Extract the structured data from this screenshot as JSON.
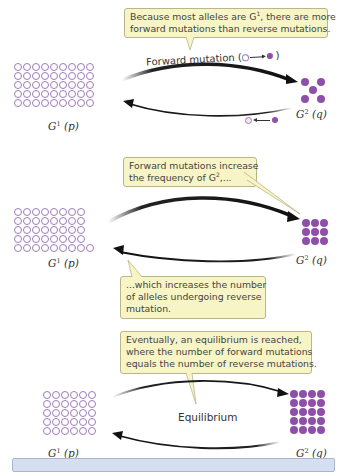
{
  "colors": {
    "allele_g1_outline": "#9d7cb8",
    "allele_g2_fill": "#8e4fa8",
    "callout_bg": "#f7f4c5",
    "callout_border": "#b9b68a",
    "caption_bg": "#d6dff0"
  },
  "panels": [
    {
      "callout_html_parts": {
        "line1_pre": "Because most alleles are G",
        "line1_sup": "1",
        "line1_post": ", there are more",
        "line2": "forward mutations than reverse mutations."
      },
      "forward_label": "Forward mutation (",
      "forward_label_close": ")",
      "g1": {
        "symbol": "G",
        "sup": "1",
        "freq": "(p)",
        "count": 45,
        "columns": 9
      },
      "g2": {
        "symbol": "G",
        "sup": "2",
        "freq": "(q)",
        "count": 5,
        "arrangement": "quincunx"
      }
    },
    {
      "callout_top": {
        "line1": "Forward mutations increase",
        "line2_pre": "the frequency of G",
        "line2_sup": "2",
        "line2_post": ",..."
      },
      "callout_bottom": {
        "line1": "...which increases the number",
        "line2": "of alleles undergoing reverse",
        "line3": "mutation."
      },
      "g1": {
        "symbol": "G",
        "sup": "1",
        "freq": "(p)",
        "count": 41,
        "columns": 8
      },
      "g2": {
        "symbol": "G",
        "sup": "2",
        "freq": "(q)",
        "count": 9,
        "columns": 3
      }
    },
    {
      "callout": {
        "line1": "Eventually, an equilibrium is reached,",
        "line2": "where the number of forward mutations",
        "line3": "equals the number of reverse mutations."
      },
      "center_label": "Equilibrium",
      "g1": {
        "symbol": "G",
        "sup": "1",
        "freq": "(p)",
        "count": 30,
        "columns": 6
      },
      "g2": {
        "symbol": "G",
        "sup": "2",
        "freq": "(q)",
        "count": 20,
        "columns": 4
      }
    }
  ],
  "caption": {
    "text": ""
  }
}
